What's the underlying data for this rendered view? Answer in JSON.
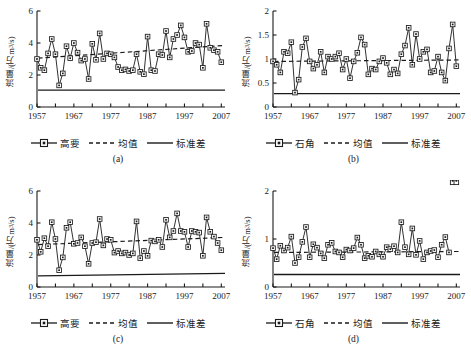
{
  "figure": {
    "axis_color": "#1a1a1a",
    "series_color": "#1a1a1a",
    "mean_color": "#1a1a1a",
    "std_color": "#1a1a1a"
  },
  "legend_labels": {
    "mean": "均值",
    "std": "标准差"
  },
  "panels": [
    {
      "caption": "(a)",
      "ylabel_text": "流量/(万m",
      "ylabel_sup": "3",
      "ylabel_tail": "/s)",
      "station": "高要",
      "chart_ref": 0
    },
    {
      "caption": "(b)",
      "ylabel_text": "流量/(万m",
      "ylabel_sup": "3",
      "ylabel_tail": "/s)",
      "station": "石角",
      "chart_ref": 1
    },
    {
      "caption": "(c)",
      "ylabel_text": "流量/(万m",
      "ylabel_sup": "3",
      "ylabel_tail": "/s)",
      "station": "高要",
      "chart_ref": 2
    },
    {
      "caption": "(d)",
      "ylabel_text": "流量/(万m",
      "ylabel_sup": "3",
      "ylabel_tail": "/s)",
      "station": "石角",
      "chart_ref": 3
    }
  ],
  "chart_data": [
    {
      "type": "line",
      "panel": "(a)",
      "title": "",
      "xlabel": "",
      "ylabel": "流量/(万m3/s)",
      "xlim": [
        1957,
        2008
      ],
      "ylim": [
        0,
        6
      ],
      "yticks": [
        0,
        2,
        4,
        6
      ],
      "ytick_labels": [
        "0",
        "2",
        "4",
        "6"
      ],
      "xticks": [
        1957,
        1967,
        1977,
        1987,
        1997,
        2007
      ],
      "xtick_labels": [
        "1957",
        "1967",
        "1977",
        "1987",
        "1997",
        "2007"
      ],
      "xminor_step": 5,
      "grid": false,
      "legend_position": "below",
      "series": [
        {
          "name": "高要",
          "style": "line-marker-square",
          "x": [
            1957,
            1958,
            1959,
            1960,
            1961,
            1962,
            1963,
            1964,
            1965,
            1966,
            1967,
            1968,
            1969,
            1970,
            1971,
            1972,
            1973,
            1974,
            1975,
            1976,
            1977,
            1978,
            1979,
            1980,
            1981,
            1982,
            1983,
            1984,
            1985,
            1986,
            1987,
            1988,
            1989,
            1990,
            1991,
            1992,
            1993,
            1994,
            1995,
            1996,
            1997,
            1998,
            1999,
            2000,
            2001,
            2002,
            2003,
            2004,
            2005,
            2006,
            2007
          ],
          "values": [
            3.0,
            2.45,
            2.3,
            3.35,
            4.25,
            3.3,
            1.35,
            2.1,
            3.8,
            3.05,
            4.0,
            3.4,
            2.9,
            3.0,
            1.75,
            3.95,
            2.95,
            4.6,
            3.0,
            3.35,
            3.3,
            3.1,
            2.5,
            2.3,
            2.35,
            2.25,
            2.3,
            3.3,
            2.2,
            2.05,
            4.4,
            2.3,
            2.25,
            3.3,
            3.25,
            4.75,
            3.1,
            4.25,
            4.5,
            5.1,
            4.35,
            3.45,
            3.5,
            4.0,
            3.9,
            2.45,
            5.2,
            3.7,
            3.55,
            3.45,
            2.8
          ]
        }
      ],
      "reference_lines": [
        {
          "name": "均值",
          "style": "dashed",
          "y_start": 3.05,
          "y_end": 3.85
        },
        {
          "name": "标准差",
          "style": "solid",
          "y_start": 1.05,
          "y_end": 1.05
        }
      ]
    },
    {
      "type": "line",
      "panel": "(b)",
      "title": "",
      "xlabel": "",
      "ylabel": "流量/(万m3/s)",
      "xlim": [
        1957,
        2008
      ],
      "ylim": [
        0,
        2
      ],
      "yticks": [
        0,
        0.5,
        1,
        1.5,
        2
      ],
      "ytick_labels": [
        "0",
        "0.5",
        "1",
        "1.5",
        "2"
      ],
      "xticks": [
        1957,
        1967,
        1977,
        1987,
        1997,
        2007
      ],
      "xtick_labels": [
        "1957",
        "1967",
        "1977",
        "1987",
        "1997",
        "2007"
      ],
      "xminor_step": 5,
      "grid": false,
      "legend_position": "below",
      "series": [
        {
          "name": "石角",
          "style": "line-marker-square",
          "x": [
            1957,
            1958,
            1959,
            1960,
            1961,
            1962,
            1963,
            1964,
            1965,
            1966,
            1967,
            1968,
            1969,
            1970,
            1971,
            1972,
            1973,
            1974,
            1975,
            1976,
            1977,
            1978,
            1979,
            1980,
            1981,
            1982,
            1983,
            1984,
            1985,
            1986,
            1987,
            1988,
            1989,
            1990,
            1991,
            1992,
            1993,
            1994,
            1995,
            1996,
            1997,
            1998,
            1999,
            2000,
            2001,
            2002,
            2003,
            2004,
            2005,
            2006,
            2007
          ],
          "values": [
            0.95,
            0.88,
            0.72,
            1.15,
            1.12,
            1.35,
            0.3,
            0.57,
            1.25,
            1.43,
            0.95,
            0.8,
            0.88,
            1.15,
            0.72,
            1.05,
            1.0,
            1.05,
            1.12,
            0.78,
            1.0,
            0.6,
            0.95,
            1.13,
            1.45,
            1.3,
            0.68,
            0.8,
            0.78,
            0.95,
            1.02,
            0.92,
            0.68,
            0.78,
            0.7,
            1.1,
            1.28,
            1.65,
            0.88,
            1.52,
            1.0,
            1.15,
            1.2,
            0.72,
            0.75,
            1.05,
            0.72,
            0.55,
            1.22,
            1.72,
            0.85
          ]
        }
      ],
      "reference_lines": [
        {
          "name": "均值",
          "style": "dashed",
          "y_start": 0.95,
          "y_end": 0.98
        },
        {
          "name": "标准差",
          "style": "solid",
          "y_start": 0.28,
          "y_end": 0.28
        }
      ]
    },
    {
      "type": "line",
      "panel": "(c)",
      "title": "",
      "xlabel": "",
      "ylabel": "流量/(万m3/s)",
      "xlim": [
        1957,
        2008
      ],
      "ylim": [
        0,
        6
      ],
      "yticks": [
        0,
        2,
        4,
        6
      ],
      "ytick_labels": [
        "0",
        "2",
        "4",
        "6"
      ],
      "xticks": [
        1957,
        1967,
        1977,
        1987,
        1997,
        2007
      ],
      "xtick_labels": [
        "1957",
        "1967",
        "1977",
        "1987",
        "1997",
        "2007"
      ],
      "xminor_step": 5,
      "grid": false,
      "legend_position": "below",
      "series": [
        {
          "name": "高要",
          "style": "line-marker-square",
          "x": [
            1957,
            1958,
            1959,
            1960,
            1961,
            1962,
            1963,
            1964,
            1965,
            1966,
            1967,
            1968,
            1969,
            1970,
            1971,
            1972,
            1973,
            1974,
            1975,
            1976,
            1977,
            1978,
            1979,
            1980,
            1981,
            1982,
            1983,
            1984,
            1985,
            1986,
            1987,
            1988,
            1989,
            1990,
            1991,
            1992,
            1993,
            1994,
            1995,
            1996,
            1997,
            1998,
            1999,
            2000,
            2001,
            2002,
            2003,
            2004,
            2005,
            2006,
            2007
          ],
          "values": [
            2.95,
            2.2,
            3.05,
            2.55,
            4.05,
            3.0,
            1.05,
            1.85,
            3.7,
            4.05,
            2.7,
            2.75,
            3.1,
            2.55,
            1.45,
            2.75,
            2.8,
            4.25,
            2.6,
            3.0,
            2.95,
            2.15,
            2.25,
            2.1,
            2.15,
            2.0,
            2.1,
            4.1,
            1.8,
            2.25,
            1.95,
            2.9,
            2.85,
            2.95,
            2.5,
            4.2,
            3.1,
            3.5,
            4.6,
            3.5,
            3.45,
            2.5,
            3.5,
            3.45,
            3.4,
            1.95,
            4.35,
            3.45,
            3.15,
            2.75,
            2.3
          ]
        }
      ],
      "reference_lines": [
        {
          "name": "均值",
          "style": "dashed",
          "y_start": 2.65,
          "y_end": 3.1
        },
        {
          "name": "标准差",
          "style": "solid",
          "y_start": 0.7,
          "y_end": 0.85
        }
      ]
    },
    {
      "type": "line",
      "panel": "(d)",
      "title": "",
      "xlabel": "",
      "ylabel": "流量/(万m3/s)",
      "xlim": [
        1957,
        2008
      ],
      "ylim": [
        0,
        2
      ],
      "yticks": [
        0,
        1,
        2
      ],
      "ytick_labels": [
        "0",
        "1",
        "2"
      ],
      "xticks": [
        1957,
        1967,
        1977,
        1987,
        1997,
        2007
      ],
      "xtick_labels": [
        "1957",
        "1967",
        "1977",
        "1987",
        "1997",
        "2007"
      ],
      "xminor_step": 5,
      "grid": false,
      "legend_position": "below",
      "series": [
        {
          "name": "石角",
          "style": "line-marker-square",
          "x": [
            1957,
            1958,
            1959,
            1960,
            1961,
            1962,
            1963,
            1964,
            1965,
            1966,
            1967,
            1968,
            1969,
            1970,
            1971,
            1972,
            1973,
            1974,
            1975,
            1976,
            1977,
            1978,
            1979,
            1980,
            1981,
            1982,
            1983,
            1984,
            1985,
            1986,
            1987,
            1988,
            1989,
            1990,
            1991,
            1992,
            1993,
            1994,
            1995,
            1996,
            1997,
            1998,
            1999,
            2000,
            2001,
            2002,
            2003,
            2004,
            2005,
            2006,
            2007
          ],
          "values": [
            0.81,
            0.58,
            0.86,
            0.76,
            0.82,
            1.05,
            0.5,
            0.62,
            0.94,
            1.25,
            0.62,
            0.89,
            0.82,
            0.7,
            0.6,
            0.88,
            0.92,
            0.74,
            0.72,
            0.62,
            0.78,
            0.76,
            0.81,
            1.03,
            0.88,
            0.6,
            0.65,
            0.63,
            0.74,
            0.68,
            0.63,
            0.83,
            0.79,
            0.85,
            0.72,
            1.35,
            0.83,
            0.68,
            1.22,
            0.67,
            0.96,
            0.58,
            0.72,
            0.75,
            0.77,
            0.62,
            0.88,
            1.04,
            0.72
          ]
        }
      ],
      "reference_lines": [
        {
          "name": "均值",
          "style": "dashed",
          "y_start": 0.72,
          "y_end": 0.74
        },
        {
          "name": "标准差",
          "style": "solid",
          "y_start": 0.26,
          "y_end": 0.26
        }
      ]
    }
  ]
}
